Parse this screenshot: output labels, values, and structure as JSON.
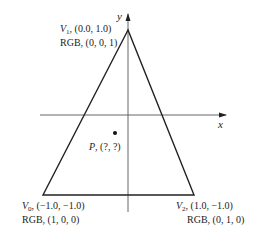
{
  "diagram": {
    "axes": {
      "x_label": "x",
      "y_label": "y"
    },
    "vertices": [
      {
        "id": "V0",
        "name": "V",
        "sub": "0",
        "coords": "(−1.0, −1.0)",
        "rgb_label": "RGB, (1, 0, 0)"
      },
      {
        "id": "V1",
        "name": "V",
        "sub": "1",
        "coords": "(0.0, 1.0)",
        "rgb_label": "RGB, (0, 0, 1)"
      },
      {
        "id": "V2",
        "name": "V",
        "sub": "2",
        "coords": "(1.0, −1.0)",
        "rgb_label": "RGB, (0, 1, 0)"
      }
    ],
    "point": {
      "name": "P",
      "coords": "(?, ?)"
    },
    "colors": {
      "line": "#222222",
      "axis": "#555555"
    }
  }
}
